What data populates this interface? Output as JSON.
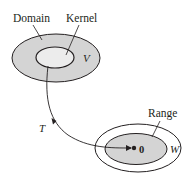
{
  "diagram": {
    "domain_space": {
      "label": "Domain",
      "space_symbol": "V",
      "fill": "#d4d4d4",
      "kernel": {
        "label": "Kernel",
        "fill": "#ececec"
      }
    },
    "codomain_space": {
      "space_symbol": "W",
      "fill": "#ffffff",
      "range": {
        "label": "Range",
        "fill": "#d4d4d4"
      },
      "zero_vector_label": "0"
    },
    "transformation": {
      "label": "T"
    },
    "colors": {
      "stroke": "#231f20",
      "shaded": "#d4d4d4",
      "light": "#ececec",
      "background": "#ffffff"
    }
  }
}
